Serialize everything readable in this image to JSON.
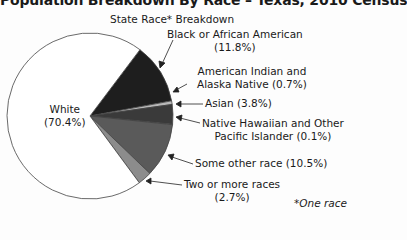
{
  "chart_data": {
    "type": "pie",
    "title": "Population Breakdown By Race – Texas, 2010 Census",
    "subtitle": "State Race* Breakdown",
    "footnote": "*One race",
    "start_angle_deg": 37,
    "direction": "clockwise",
    "slices": [
      {
        "name": "Black or African American",
        "value": 11.8,
        "color": "#1e1e1e"
      },
      {
        "name": "American Indian and Alaska Native",
        "value": 0.7,
        "color": "#b8b8b8"
      },
      {
        "name": "Asian",
        "value": 3.8,
        "color": "#3a3a3a"
      },
      {
        "name": "Native Hawaiian and Other Pacific Islander",
        "value": 0.1,
        "color": "#a8a8a8"
      },
      {
        "name": "Some other race",
        "value": 10.5,
        "color": "#5a5a5a"
      },
      {
        "name": "Two or more races",
        "value": 2.7,
        "color": "#8c8c8c"
      },
      {
        "name": "White",
        "value": 70.4,
        "color": "#ffffff"
      }
    ]
  },
  "labels": {
    "white_name": "White",
    "white_pct": "(70.4%)",
    "black_name": "Black or African American",
    "black_pct": "(11.8%)",
    "amind_line1": "American Indian and",
    "amind_line2": "Alaska Native (0.7%)",
    "asian": "Asian (3.8%)",
    "nhpi_line1": "Native Hawaiian and Other",
    "nhpi_line2": "Pacific Islander (0.1%)",
    "other": "Some other race (10.5%)",
    "two_line1": "Two or more races",
    "two_line2": "(2.7%)"
  }
}
